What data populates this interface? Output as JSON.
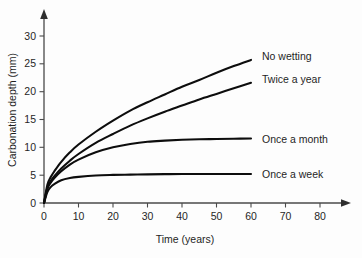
{
  "chart_data": {
    "type": "line",
    "title": "",
    "xlabel": "Time (years)",
    "ylabel": "Carbonation depth (mm)",
    "xlim": [
      0,
      85
    ],
    "ylim": [
      0,
      32
    ],
    "xticks": [
      0,
      10,
      20,
      30,
      40,
      50,
      60,
      70,
      80
    ],
    "yticks": [
      0,
      5,
      10,
      15,
      20,
      25,
      30
    ],
    "grid": false,
    "legend_position": "inline-right-of-curve-ends",
    "x": [
      0,
      1,
      2,
      3,
      5,
      7.5,
      10,
      15,
      20,
      25,
      30,
      35,
      40,
      45,
      50,
      55,
      60
    ],
    "series": [
      {
        "name": "No wetting",
        "label": "No wetting",
        "color": "#0d0d0d",
        "values": [
          0,
          3.3,
          4.7,
          5.7,
          7.4,
          9.1,
          10.5,
          12.8,
          14.8,
          16.6,
          18.1,
          19.5,
          20.9,
          22.1,
          23.4,
          24.6,
          25.7
        ]
      },
      {
        "name": "Twice a year",
        "label": "Twice a year",
        "color": "#0d0d0d",
        "values": [
          0,
          2.8,
          4.0,
          4.8,
          6.2,
          7.6,
          8.8,
          10.8,
          12.4,
          13.9,
          15.2,
          16.4,
          17.5,
          18.6,
          19.6,
          20.6,
          21.6
        ]
      },
      {
        "name": "Once a month",
        "label": "Once a month",
        "color": "#0d0d0d",
        "values": [
          0,
          2.6,
          3.7,
          4.5,
          5.7,
          6.9,
          7.8,
          9.1,
          10.0,
          10.6,
          11.0,
          11.2,
          11.35,
          11.45,
          11.5,
          11.55,
          11.6
        ]
      },
      {
        "name": "Once a week",
        "label": "Once a week",
        "color": "#0d0d0d",
        "values": [
          0,
          2.0,
          2.9,
          3.4,
          4.1,
          4.5,
          4.7,
          4.95,
          5.05,
          5.1,
          5.15,
          5.18,
          5.2,
          5.2,
          5.2,
          5.2,
          5.2
        ]
      }
    ]
  },
  "axes": {
    "x_title": "Time (years)",
    "y_title": "Carbonation depth (mm)",
    "x_tick_labels": [
      "0",
      "10",
      "20",
      "30",
      "40",
      "50",
      "60",
      "70",
      "80"
    ],
    "y_tick_labels": [
      "0",
      "5",
      "10",
      "15",
      "20",
      "25",
      "30"
    ]
  },
  "labels": {
    "no_wetting": "No wetting",
    "twice_a_year": "Twice a year",
    "once_a_month": "Once a month",
    "once_a_week": "Once a week"
  },
  "colors": {
    "curve": "#0d0d0d",
    "axis": "#4a4a4a",
    "text": "#1f1f1f",
    "background": "#fdfdfd"
  }
}
